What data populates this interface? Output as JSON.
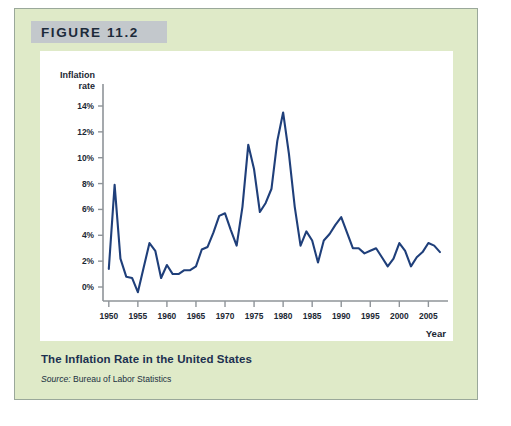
{
  "figure": {
    "header_label": "FIGURE 11.2",
    "caption_title": "The Inflation Rate in the United States",
    "source_prefix": "Source:",
    "source_text": "Bureau of Labor Statistics"
  },
  "colors": {
    "panel_background": "#dfeac8",
    "panel_border": "#9aa89a",
    "header_background": "#c3c8cc",
    "plot_background": "#ffffff",
    "line": "#1f3f7a",
    "axis": "#8f9499",
    "text": "#1b2733",
    "caption_title": "#1c3050"
  },
  "chart_data": {
    "type": "line",
    "title": "The Inflation Rate in the United States",
    "xlabel": "Year",
    "ylabel": "Inflation rate",
    "ylabel_line1": "Inflation",
    "ylabel_line2": "rate",
    "xlim": [
      1949,
      2007
    ],
    "ylim": [
      -1,
      14
    ],
    "grid": false,
    "legend": null,
    "ytick_values": [
      0,
      2,
      4,
      6,
      8,
      10,
      12,
      14
    ],
    "ytick_labels": [
      "0%",
      "2%",
      "4%",
      "6%",
      "8%",
      "10%",
      "12%",
      "14%"
    ],
    "xtick_values": [
      1950,
      1955,
      1960,
      1965,
      1970,
      1975,
      1980,
      1985,
      1990,
      1995,
      2000,
      2005
    ],
    "xtick_labels": [
      "1950",
      "1955",
      "1960",
      "1965",
      "1970",
      "1975",
      "1980",
      "1985",
      "1990",
      "1995",
      "2000",
      "2005"
    ],
    "series": [
      {
        "name": "Inflation rate",
        "color": "#1f3f7a",
        "x": [
          1950,
          1951,
          1952,
          1953,
          1954,
          1955,
          1956,
          1957,
          1958,
          1959,
          1960,
          1961,
          1962,
          1963,
          1964,
          1965,
          1966,
          1967,
          1968,
          1969,
          1970,
          1971,
          1972,
          1973,
          1974,
          1975,
          1976,
          1977,
          1978,
          1979,
          1980,
          1981,
          1982,
          1983,
          1984,
          1985,
          1986,
          1987,
          1988,
          1989,
          1990,
          1991,
          1992,
          1993,
          1994,
          1995,
          1996,
          1997,
          1998,
          1999,
          2000,
          2001,
          2002,
          2003,
          2004,
          2005,
          2006,
          2007
        ],
        "y": [
          1.4,
          7.9,
          2.2,
          0.8,
          0.7,
          -0.4,
          1.5,
          3.4,
          2.8,
          0.7,
          1.7,
          1.0,
          1.0,
          1.3,
          1.3,
          1.6,
          2.9,
          3.1,
          4.2,
          5.5,
          5.7,
          4.4,
          3.2,
          6.2,
          11.0,
          9.1,
          5.8,
          6.5,
          7.6,
          11.3,
          13.5,
          10.3,
          6.2,
          3.2,
          4.3,
          3.6,
          1.9,
          3.6,
          4.1,
          4.8,
          5.4,
          4.2,
          3.0,
          3.0,
          2.6,
          2.8,
          3.0,
          2.3,
          1.6,
          2.2,
          3.4,
          2.8,
          1.6,
          2.3,
          2.7,
          3.4,
          3.2,
          2.7
        ]
      }
    ]
  }
}
